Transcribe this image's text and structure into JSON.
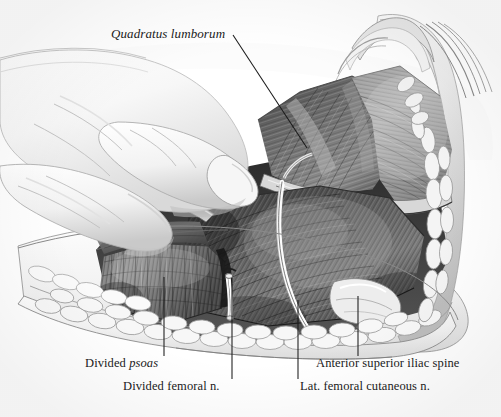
{
  "figure": {
    "medium": "grayscale pencil and wash anatomical illustration",
    "background_color": "#ffffff",
    "ink_color": "#1a1a1a",
    "width": 501,
    "height": 417
  },
  "labels": {
    "quadratus": {
      "pre": "",
      "italic": "Quadratus lumborum",
      "post": ""
    },
    "divided_psoas": {
      "pre": "Divided ",
      "italic": "psoas",
      "post": ""
    },
    "divided_femoral": {
      "pre": "Divided femoral n.",
      "italic": "",
      "post": ""
    },
    "asis": {
      "pre": "Anterior superior iliac spine",
      "italic": "",
      "post": ""
    },
    "lfcn": {
      "pre": "Lat. femoral cutaneous n.",
      "italic": "",
      "post": ""
    }
  },
  "leader_lines": [
    {
      "name": "quadratus-leader",
      "x1": 233,
      "y1": 35,
      "x2": 307,
      "y2": 148
    },
    {
      "name": "divided-psoas-leader",
      "x1": 164,
      "y1": 277,
      "x2": 164,
      "y2": 356
    },
    {
      "name": "divided-femoral-leader",
      "x1": 232,
      "y1": 278,
      "x2": 232,
      "y2": 379
    },
    {
      "name": "asis-leader",
      "x1": 358,
      "y1": 296,
      "x2": 358,
      "y2": 356
    },
    {
      "name": "lfcn-leader",
      "x1": 298,
      "y1": 300,
      "x2": 298,
      "y2": 379
    }
  ],
  "anatomy_structures": [
    "Quadratus lumborum muscle",
    "Divided psoas major muscle",
    "Divided femoral nerve",
    "Lateral femoral cutaneous nerve",
    "Anterior superior iliac spine",
    "Iliacus muscle",
    "Subcutaneous fat lobules at wound edge",
    "Surgeon's gloved hand",
    "Surgical retractor / dissector instrument"
  ]
}
